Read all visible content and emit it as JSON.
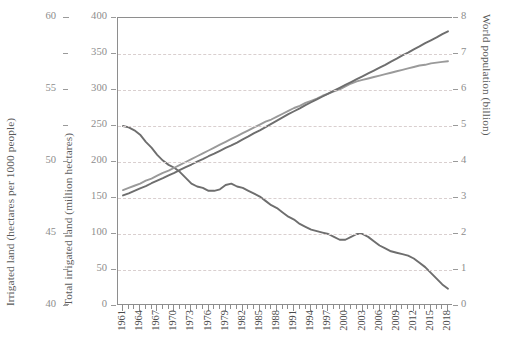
{
  "chart_data": {
    "type": "line",
    "title": "",
    "xlabel": "",
    "x": [
      1961,
      1962,
      1963,
      1964,
      1965,
      1966,
      1967,
      1968,
      1969,
      1970,
      1971,
      1972,
      1973,
      1974,
      1975,
      1976,
      1977,
      1978,
      1979,
      1980,
      1981,
      1982,
      1983,
      1984,
      1985,
      1986,
      1987,
      1988,
      1989,
      1990,
      1991,
      1992,
      1993,
      1994,
      1995,
      1996,
      1997,
      1998,
      1999,
      2000,
      2001,
      2002,
      2003,
      2004,
      2005,
      2006,
      2007,
      2008,
      2009,
      2010,
      2011,
      2012,
      2013,
      2014,
      2015,
      2016,
      2017,
      2018
    ],
    "tick_labels_x": [
      "1961",
      "1964",
      "1967",
      "1970",
      "1973",
      "1976",
      "1979",
      "1982",
      "1985",
      "1988",
      "1991",
      "1994",
      "1997",
      "2000",
      "2003",
      "2006",
      "2009",
      "2012",
      "2015",
      "2018"
    ],
    "grid": "horizontal-dashed",
    "legend": "none",
    "axes": [
      {
        "id": "outer-left",
        "label": "Irrigated land (hectares per 1000 people)",
        "min": 40,
        "max": 60,
        "ticks": [
          40,
          45,
          50,
          55,
          60
        ],
        "minor_step": 2.5,
        "tick_labels": [
          "40",
          "45",
          "50",
          "55",
          "60"
        ]
      },
      {
        "id": "inner-left",
        "label": "Total irrigated land (million hectares)",
        "min": 0,
        "max": 400,
        "ticks": [
          0,
          50,
          100,
          150,
          200,
          250,
          300,
          350,
          400
        ],
        "tick_labels": [
          "0",
          "50",
          "100",
          "150",
          "200",
          "250",
          "300",
          "350",
          "400"
        ]
      },
      {
        "id": "right",
        "label": "World population (billion)",
        "min": 0,
        "max": 8,
        "ticks": [
          0,
          1,
          2,
          3,
          4,
          5,
          6,
          7,
          8
        ],
        "tick_labels": [
          "0",
          "1",
          "2",
          "3",
          "4",
          "5",
          "6",
          "7",
          "8"
        ]
      }
    ],
    "series": [
      {
        "name": "Irrigated land per 1000 people",
        "axis": "outer-left",
        "unit": "hectares per 1000 people",
        "color": "#6e6e6e",
        "values": [
          52.5,
          52.4,
          52.2,
          51.9,
          51.4,
          51.0,
          50.5,
          50.1,
          49.8,
          49.6,
          49.3,
          48.9,
          48.5,
          48.3,
          48.2,
          48.0,
          48.0,
          48.1,
          48.4,
          48.5,
          48.3,
          48.2,
          48.0,
          47.8,
          47.6,
          47.3,
          47.0,
          46.8,
          46.5,
          46.2,
          46.0,
          45.7,
          45.5,
          45.3,
          45.2,
          45.1,
          45.0,
          44.8,
          44.6,
          44.6,
          44.8,
          45.0,
          45.0,
          44.8,
          44.5,
          44.2,
          44.0,
          43.8,
          43.7,
          43.6,
          43.5,
          43.3,
          43.0,
          42.7,
          42.3,
          41.9,
          41.5,
          41.2
        ]
      },
      {
        "name": "Total irrigated land",
        "axis": "inner-left",
        "unit": "million hectares",
        "color": "#9a9a9a",
        "values": [
          161,
          164,
          167,
          170,
          174,
          177,
          181,
          185,
          188,
          192,
          196,
          200,
          204,
          208,
          212,
          216,
          220,
          224,
          228,
          232,
          236,
          240,
          244,
          248,
          252,
          256,
          259,
          263,
          267,
          271,
          275,
          278,
          282,
          285,
          288,
          292,
          295,
          298,
          301,
          305,
          309,
          312,
          314,
          316,
          318,
          320,
          322,
          324,
          326,
          328,
          330,
          332,
          334,
          335,
          337,
          338,
          339,
          340
        ]
      },
      {
        "name": "World population",
        "axis": "right",
        "unit": "billion",
        "color": "#6e6e6e",
        "values": [
          3.07,
          3.13,
          3.2,
          3.27,
          3.33,
          3.41,
          3.48,
          3.55,
          3.63,
          3.7,
          3.78,
          3.86,
          3.93,
          4.01,
          4.08,
          4.16,
          4.23,
          4.31,
          4.39,
          4.46,
          4.54,
          4.63,
          4.71,
          4.8,
          4.88,
          4.97,
          5.06,
          5.15,
          5.24,
          5.33,
          5.41,
          5.49,
          5.58,
          5.66,
          5.74,
          5.82,
          5.9,
          5.98,
          6.06,
          6.14,
          6.22,
          6.3,
          6.38,
          6.46,
          6.54,
          6.62,
          6.7,
          6.79,
          6.87,
          6.96,
          7.04,
          7.13,
          7.21,
          7.3,
          7.38,
          7.46,
          7.55,
          7.63
        ]
      }
    ]
  },
  "colors": {
    "axis": "#8e8e8e",
    "grid": "#d9cfcf",
    "tick_label": "#8d8d8d",
    "x_label": "#4a4a4a",
    "background": "#ffffff"
  }
}
